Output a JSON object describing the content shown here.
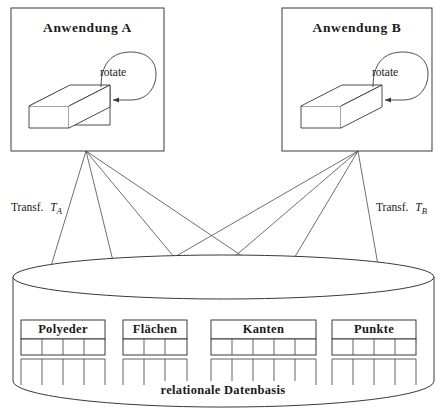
{
  "figure": {
    "caption": "relationale Datenbasis",
    "applications": [
      {
        "id": "a",
        "title": "Anwendung A",
        "operation_label": "rotate",
        "object_icon": "3d-box-icon",
        "loop_arrow_icon": "rotate-loop-arrow-icon"
      },
      {
        "id": "b",
        "title": "Anwendung B",
        "operation_label": "rotate",
        "object_icon": "3d-box-icon",
        "loop_arrow_icon": "rotate-loop-arrow-icon"
      }
    ],
    "transformations": [
      {
        "id": "a",
        "prefix": "Transf.",
        "symbol": "T",
        "subscript": "A"
      },
      {
        "id": "b",
        "prefix": "Transf.",
        "symbol": "T",
        "subscript": "B"
      }
    ],
    "database": {
      "label": "relationale Datenbasis",
      "shape_icon": "database-cylinder-icon",
      "tables": [
        {
          "name": "Polyeder",
          "columns": 4
        },
        {
          "name": "Flächen",
          "columns": 3
        },
        {
          "name": "Kanten",
          "columns": 5
        },
        {
          "name": "Punkte",
          "columns": 4
        }
      ]
    },
    "colors": {
      "stroke": "#3a3a3a",
      "text": "#1a1a1a",
      "background": "#ffffff"
    }
  }
}
